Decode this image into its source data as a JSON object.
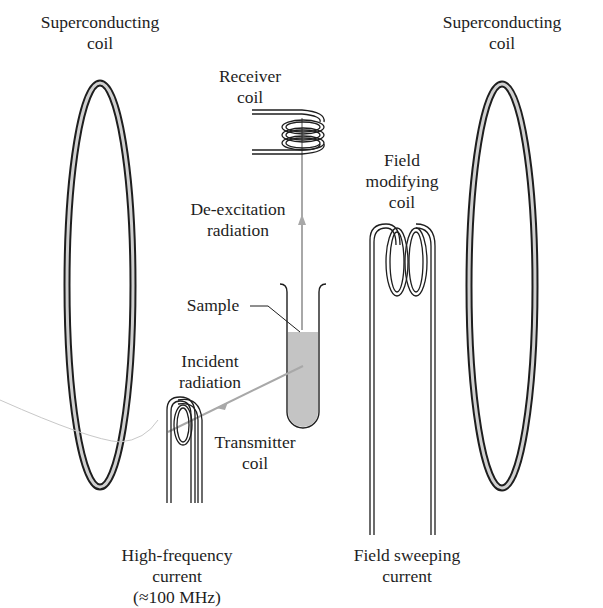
{
  "diagram": {
    "type": "NMR spectrometer schematic",
    "colors": {
      "line": "#1e1e1e",
      "radiation": "#a8a8a8",
      "sample_fill": "#c4c4c4",
      "coil_inner": "#d0d0d0",
      "background": "#ffffff"
    },
    "labels": {
      "superconducting_left": {
        "line1": "Superconducting",
        "line2": "coil"
      },
      "superconducting_right": {
        "line1": "Superconducting",
        "line2": "coil"
      },
      "receiver": {
        "line1": "Receiver",
        "line2": "coil"
      },
      "deexcitation": {
        "line1": "De-excitation",
        "line2": "radiation"
      },
      "field_modifying": {
        "line1": "Field",
        "line2": "modifying",
        "line3": "coil"
      },
      "sample": {
        "line1": "Sample"
      },
      "incident": {
        "line1": "Incident",
        "line2": "radiation"
      },
      "transmitter": {
        "line1": "Transmitter",
        "line2": "coil"
      },
      "high_frequency": {
        "line1": "High-frequency",
        "line2": "current",
        "line3": "(≈100 MHz)"
      },
      "field_sweeping": {
        "line1": "Field sweeping",
        "line2": "current"
      }
    },
    "components": [
      "superconducting-coil-left",
      "superconducting-coil-right",
      "receiver-coil",
      "transmitter-coil",
      "field-modifying-coil",
      "sample-tube",
      "de-excitation-radiation-arrow",
      "incident-radiation-arrow"
    ]
  }
}
